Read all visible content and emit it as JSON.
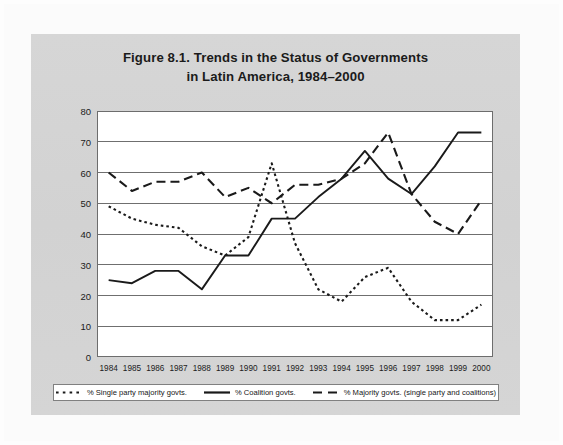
{
  "figure": {
    "title_line1": "Figure 8.1. Trends in the Status of Governments",
    "title_line2": "in Latin America, 1984–2000",
    "panel_color": "#d4d4d4",
    "plot_bg": "#ffffff",
    "line_color": "#1a1a1a"
  },
  "legend": {
    "position": "bottom",
    "items": [
      {
        "label": "% Single party majority govts.",
        "style": "dotted",
        "icon": "dotted-line-swatch"
      },
      {
        "label": "% Coalition govts.",
        "style": "solid",
        "icon": "solid-line-swatch"
      },
      {
        "label": "% Majority govts. (single party and coalitions)",
        "style": "dashed",
        "icon": "dashed-line-swatch"
      }
    ]
  },
  "chart_data": {
    "type": "line",
    "title": "Figure 8.1. Trends in the Status of Governments in Latin America, 1984–2000",
    "xlabel": "",
    "ylabel": "",
    "ylim": [
      0,
      80
    ],
    "yticks": [
      0,
      10,
      20,
      30,
      40,
      50,
      60,
      70,
      80
    ],
    "grid": true,
    "grid_axis": "y",
    "legend_position": "bottom",
    "categories": [
      "1984",
      "1985",
      "1986",
      "1987",
      "1988",
      "1989",
      "1990",
      "1991",
      "1992",
      "1993",
      "1994",
      "1995",
      "1996",
      "1997",
      "1998",
      "1999",
      "2000"
    ],
    "x": [
      1984,
      1985,
      1986,
      1987,
      1988,
      1989,
      1990,
      1991,
      1992,
      1993,
      1994,
      1995,
      1996,
      1997,
      1998,
      1999,
      2000
    ],
    "series": [
      {
        "name": "% Single party majority govts.",
        "style": "dotted",
        "values": [
          49,
          45,
          43,
          42,
          36,
          33,
          39,
          63,
          37,
          22,
          18,
          26,
          29,
          18,
          12,
          12,
          17
        ]
      },
      {
        "name": "% Coalition govts.",
        "style": "solid",
        "values": [
          25,
          24,
          28,
          28,
          22,
          33,
          33,
          45,
          45,
          52,
          58,
          67,
          58,
          53,
          62,
          73,
          73
        ]
      },
      {
        "name": "% Majority govts. (single party and coalitions)",
        "style": "dashed",
        "values": [
          60,
          54,
          57,
          57,
          60,
          52,
          55,
          50,
          56,
          56,
          58,
          63,
          73,
          53,
          44,
          40,
          51
        ]
      }
    ]
  }
}
